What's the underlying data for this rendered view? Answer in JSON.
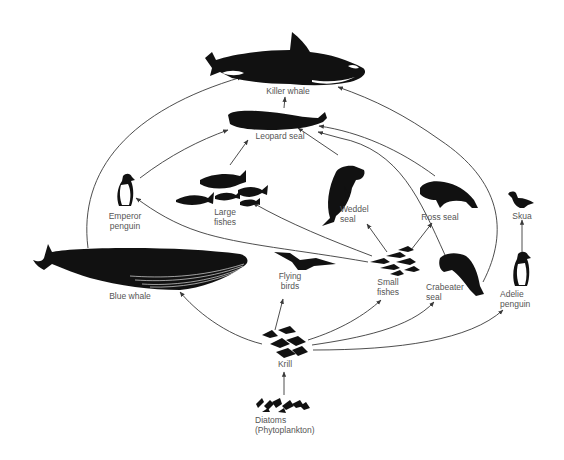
{
  "colors": {
    "ink": "#111111",
    "label": "#555555",
    "arrow": "#3a3a3a",
    "background": "#ffffff"
  },
  "nodes": [
    {
      "id": "killer_whale",
      "label": "Killer whale"
    },
    {
      "id": "leopard_seal",
      "label": "Leopard seal"
    },
    {
      "id": "emperor_penguin",
      "label": "Emperor\npenguin"
    },
    {
      "id": "large_fishes",
      "label": "Large\nfishes"
    },
    {
      "id": "weddel_seal",
      "label": "Weddel\nseal"
    },
    {
      "id": "ross_seal",
      "label": "Ross seal"
    },
    {
      "id": "skua",
      "label": "Skua"
    },
    {
      "id": "blue_whale",
      "label": "Blue whale"
    },
    {
      "id": "flying_birds",
      "label": "Flying\nbirds"
    },
    {
      "id": "small_fishes",
      "label": "Small\nfishes"
    },
    {
      "id": "crabeater_seal",
      "label": "Crabeater\nseal"
    },
    {
      "id": "adelie_penguin",
      "label": "Adelie\npenguin"
    },
    {
      "id": "krill",
      "label": "Krill"
    },
    {
      "id": "diatoms",
      "label": "Diatoms\n(Phytoplankton)"
    }
  ],
  "edges": [
    {
      "from": "diatoms",
      "to": "krill"
    },
    {
      "from": "krill",
      "to": "blue_whale"
    },
    {
      "from": "krill",
      "to": "flying_birds"
    },
    {
      "from": "krill",
      "to": "small_fishes"
    },
    {
      "from": "krill",
      "to": "crabeater_seal"
    },
    {
      "from": "krill",
      "to": "adelie_penguin"
    },
    {
      "from": "small_fishes",
      "to": "large_fishes"
    },
    {
      "from": "small_fishes",
      "to": "emperor_penguin"
    },
    {
      "from": "small_fishes",
      "to": "weddel_seal"
    },
    {
      "from": "small_fishes",
      "to": "ross_seal"
    },
    {
      "from": "small_fishes",
      "to": "leopard_seal"
    },
    {
      "from": "large_fishes",
      "to": "leopard_seal"
    },
    {
      "from": "weddel_seal",
      "to": "leopard_seal"
    },
    {
      "from": "ross_seal",
      "to": "leopard_seal"
    },
    {
      "from": "emperor_penguin",
      "to": "leopard_seal"
    },
    {
      "from": "leopard_seal",
      "to": "killer_whale"
    },
    {
      "from": "blue_whale",
      "to": "killer_whale"
    },
    {
      "from": "crabeater_seal",
      "to": "killer_whale"
    },
    {
      "from": "adelie_penguin",
      "to": "skua"
    }
  ]
}
